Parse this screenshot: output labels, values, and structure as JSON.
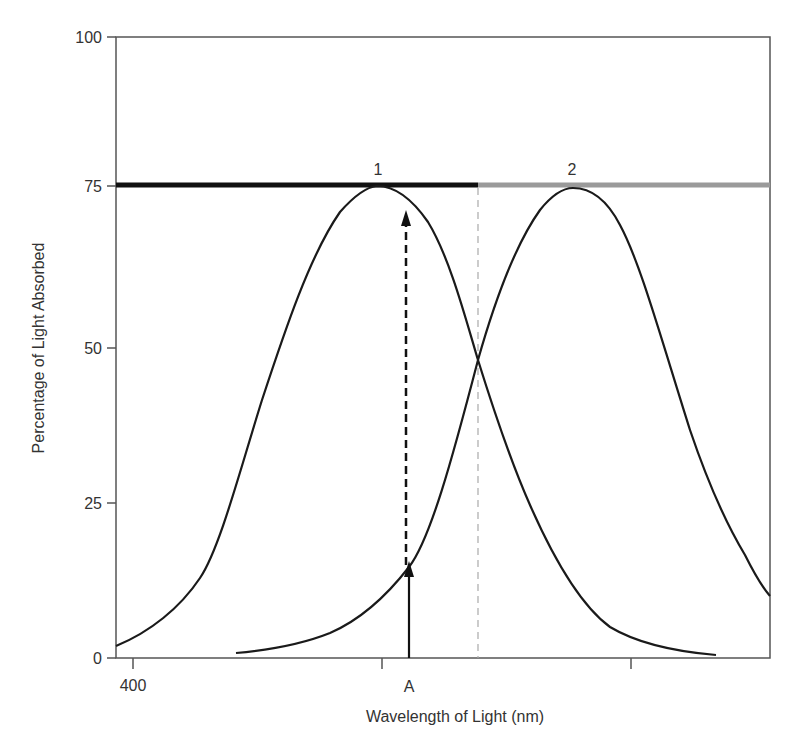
{
  "chart_data": {
    "type": "line",
    "title": "",
    "xlabel": "Wavelength of Light (nm)",
    "ylabel": "Percentage of Light Absorbed",
    "ylim": [
      0,
      100
    ],
    "yticks": [
      0,
      25,
      50,
      75,
      100
    ],
    "xtick_labels": [
      "400",
      "",
      ""
    ],
    "marker_label": "A",
    "grid": false,
    "legend": "none",
    "bars": [
      {
        "label": "1",
        "color": "#111111",
        "y": 75,
        "range": "left of crossover"
      },
      {
        "label": "2",
        "color": "#9a9a9a",
        "y": 75,
        "range": "right of crossover"
      }
    ],
    "series": [
      {
        "name": "1",
        "peak_y": 75,
        "description": "absorption curve peaking near left tick",
        "values_pct": [
          2,
          6,
          12,
          20,
          45,
          60,
          70,
          75,
          72,
          58,
          48,
          30,
          15,
          6,
          3,
          1
        ]
      },
      {
        "name": "2",
        "peak_y": 75,
        "description": "absorption curve peaking right of crossover",
        "values_pct": [
          1,
          3,
          8,
          17,
          35,
          48,
          62,
          72,
          75,
          70,
          60,
          45,
          28,
          17,
          10
        ]
      }
    ],
    "crossover_y": 48,
    "annotations": [
      {
        "type": "arrow",
        "label": "A",
        "from_y": 0,
        "to_y": 17,
        "style": "solid"
      },
      {
        "type": "arrow",
        "from_y": 17,
        "to_y": 72,
        "style": "dashed"
      },
      {
        "type": "vline",
        "at": "crossover",
        "style": "dashed",
        "color": "#aaaaaa"
      }
    ]
  },
  "axes": {
    "y_label": "Percentage of Light Absorbed",
    "x_label": "Wavelength of Light (nm)",
    "y_ticks": [
      {
        "label": "100",
        "y": 37
      },
      {
        "label": "75",
        "y": 186
      },
      {
        "label": "50",
        "y": 348
      },
      {
        "label": "25",
        "y": 503
      },
      {
        "label": "0",
        "y": 658
      }
    ],
    "x_ticks": [
      {
        "label": "400",
        "x": 133
      },
      {
        "label": "",
        "x": 382
      },
      {
        "label": "",
        "x": 631
      }
    ],
    "marker_label": "A"
  },
  "bars": {
    "bar1_label": "1",
    "bar2_label": "2",
    "bar1_color": "#111111",
    "bar2_color": "#9a9a9a"
  },
  "geometry": {
    "plot": {
      "left": 116,
      "top": 37,
      "right": 770,
      "bottom": 658
    },
    "curve1": "M116,646 C150,632 180,608 200,578 C220,548 240,470 262,400 C285,330 310,255 340,212 C355,195 366,187 377,186 C392,186 410,196 428,222 C450,258 466,320 478,360 C492,405 510,460 530,505 C552,555 580,605 610,627 C640,645 680,652 716,655",
    "curve2": "M236,653 C270,650 300,645 330,633 C360,620 385,598 409,567 C430,540 452,460 478,360 C495,300 515,245 540,210 C552,195 563,188 573,188 C588,188 605,196 620,225 C640,262 660,335 690,430 C712,495 730,530 745,555 C755,575 763,588 770,596",
    "bar1": {
      "x1": 116,
      "x2": 478,
      "y": 185
    },
    "bar2": {
      "x1": 478,
      "x2": 770,
      "y": 185
    },
    "vline_x": 478,
    "arrow_x": 409,
    "solid_arrow": {
      "y1": 658,
      "y2": 565
    },
    "dashed_arrow": {
      "y1": 565,
      "y2": 212
    }
  }
}
